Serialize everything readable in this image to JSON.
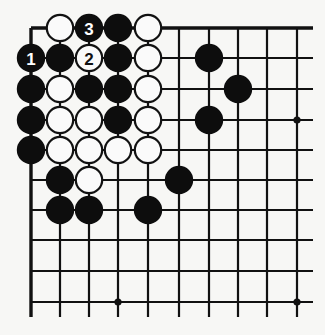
{
  "diagram": {
    "type": "go-board-partial",
    "colors": {
      "black": "#0d0d0d",
      "white": "#fafafa",
      "line": "#111111",
      "background": "#f7f7f5"
    },
    "grid": {
      "cols_x": [
        31,
        60,
        89,
        118,
        148,
        179,
        209,
        238,
        267,
        297
      ],
      "rows_y": [
        28,
        58,
        89,
        120,
        150,
        180,
        210,
        240,
        271,
        302
      ],
      "right_extent": 313,
      "bottom_extent": 317
    },
    "star_points": [
      {
        "col": 9,
        "row": 3
      },
      {
        "col": 3,
        "row": 9
      },
      {
        "col": 9,
        "row": 9
      }
    ],
    "stones": [
      {
        "color": "white",
        "col": 1,
        "row": 0,
        "label": ""
      },
      {
        "color": "black",
        "col": 2,
        "row": 0,
        "label": "3"
      },
      {
        "color": "black",
        "col": 3,
        "row": 0,
        "label": ""
      },
      {
        "color": "white",
        "col": 4,
        "row": 0,
        "label": ""
      },
      {
        "color": "black",
        "col": 0,
        "row": 1,
        "label": "1"
      },
      {
        "color": "black",
        "col": 1,
        "row": 1,
        "label": ""
      },
      {
        "color": "white",
        "col": 2,
        "row": 1,
        "label": "2"
      },
      {
        "color": "black",
        "col": 3,
        "row": 1,
        "label": ""
      },
      {
        "color": "white",
        "col": 4,
        "row": 1,
        "label": ""
      },
      {
        "color": "black",
        "col": 6,
        "row": 1,
        "label": ""
      },
      {
        "color": "black",
        "col": 0,
        "row": 2,
        "label": ""
      },
      {
        "color": "white",
        "col": 1,
        "row": 2,
        "label": ""
      },
      {
        "color": "black",
        "col": 2,
        "row": 2,
        "label": ""
      },
      {
        "color": "black",
        "col": 3,
        "row": 2,
        "label": ""
      },
      {
        "color": "white",
        "col": 4,
        "row": 2,
        "label": ""
      },
      {
        "color": "black",
        "col": 7,
        "row": 2,
        "label": ""
      },
      {
        "color": "black",
        "col": 0,
        "row": 3,
        "label": ""
      },
      {
        "color": "white",
        "col": 1,
        "row": 3,
        "label": ""
      },
      {
        "color": "white",
        "col": 2,
        "row": 3,
        "label": ""
      },
      {
        "color": "black",
        "col": 3,
        "row": 3,
        "label": ""
      },
      {
        "color": "white",
        "col": 4,
        "row": 3,
        "label": ""
      },
      {
        "color": "black",
        "col": 6,
        "row": 3,
        "label": ""
      },
      {
        "color": "black",
        "col": 0,
        "row": 4,
        "label": ""
      },
      {
        "color": "white",
        "col": 1,
        "row": 4,
        "label": ""
      },
      {
        "color": "white",
        "col": 2,
        "row": 4,
        "label": ""
      },
      {
        "color": "white",
        "col": 3,
        "row": 4,
        "label": ""
      },
      {
        "color": "white",
        "col": 4,
        "row": 4,
        "label": ""
      },
      {
        "color": "black",
        "col": 1,
        "row": 5,
        "label": ""
      },
      {
        "color": "white",
        "col": 2,
        "row": 5,
        "label": ""
      },
      {
        "color": "black",
        "col": 5,
        "row": 5,
        "label": ""
      },
      {
        "color": "black",
        "col": 1,
        "row": 6,
        "label": ""
      },
      {
        "color": "black",
        "col": 2,
        "row": 6,
        "label": ""
      },
      {
        "color": "black",
        "col": 4,
        "row": 6,
        "label": ""
      }
    ]
  }
}
